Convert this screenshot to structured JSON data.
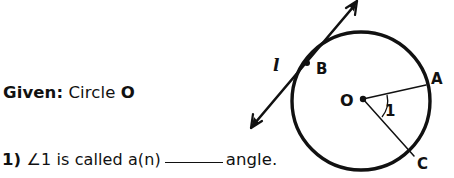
{
  "page": {
    "width": 454,
    "height": 178,
    "background": "#ffffff",
    "ink_color": "#111111"
  },
  "text": {
    "given": {
      "label": "Given:",
      "body": "Circle",
      "circle_name": "O"
    },
    "question": {
      "number": "1)",
      "part_before_blank": "∠1 is called a(n)",
      "blank": "_______",
      "part_after_blank": "angle."
    }
  },
  "diagram": {
    "type": "circle-with-tangent-and-central-angle",
    "circle": {
      "center_label": "O",
      "cx": 121,
      "cy": 101,
      "r": 69,
      "stroke_width": 3.4,
      "stroke": "#111111",
      "fill": "none"
    },
    "center_dot": {
      "cx": 123,
      "cy": 99,
      "r": 3.2
    },
    "radii": [
      {
        "name": "OA",
        "from_label": "O",
        "to_label": "A",
        "x1": 123,
        "y1": 99,
        "x2": 185,
        "y2": 85,
        "stroke_width": 1.5
      },
      {
        "name": "OC",
        "from_label": "O",
        "to_label": "C",
        "x1": 123,
        "y1": 99,
        "x2": 174,
        "y2": 155,
        "stroke_width": 1.5
      }
    ],
    "angle_arc": {
      "label": "1",
      "d": "M 146 94 A 25 25 0 0 1 141 119",
      "stroke_width": 1.3
    },
    "tangent_line": {
      "label": "l",
      "tangent_point_label": "B",
      "x1": 12,
      "y1": 127,
      "x2": 117,
      "y2": 2,
      "stroke_width": 2.6,
      "double_headed": true
    },
    "tangent_point": {
      "cx": 67,
      "cy": 63,
      "r": 3.0
    },
    "labels": [
      {
        "name": "line-label-l",
        "text": "l",
        "x": 33,
        "y": 57,
        "italic": true
      },
      {
        "name": "point-label-b",
        "text": "B",
        "x": 76,
        "y": 62,
        "italic": false
      },
      {
        "name": "point-label-a",
        "text": "A",
        "x": 191,
        "y": 72,
        "italic": false
      },
      {
        "name": "point-label-o",
        "text": "O",
        "x": 101,
        "y": 93,
        "italic": false
      },
      {
        "name": "angle-label-1",
        "text": "1",
        "x": 145,
        "y": 104,
        "italic": false
      },
      {
        "name": "point-label-c",
        "text": "C",
        "x": 177,
        "y": 157,
        "italic": false
      }
    ]
  }
}
